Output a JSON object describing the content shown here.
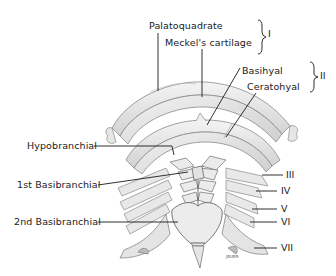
{
  "figure": {
    "labels": {
      "palatoquadrate": "Palatoquadrate",
      "meckels_cartilage": "Meckel's cartilage",
      "basihyal": "Basihyal",
      "ceratohyal": "Ceratohyal",
      "hypobranchial": "Hypobranchial",
      "first_basibranchial": "1st Basibranchial",
      "second_basibranchial": "2nd Basibranchial"
    },
    "arch_numbers": {
      "I": "I",
      "II": "II",
      "III": "III",
      "IV": "IV",
      "V": "V",
      "VI": "VI",
      "VII": "VII"
    },
    "signature": "JBURR",
    "colors": {
      "cartilage_fill": "#e9e9e9",
      "cartilage_shade": "#c9c9c9",
      "outline": "#8a8a8a",
      "leader_line": "#1a1a1a",
      "text": "#1a1a1a"
    }
  }
}
